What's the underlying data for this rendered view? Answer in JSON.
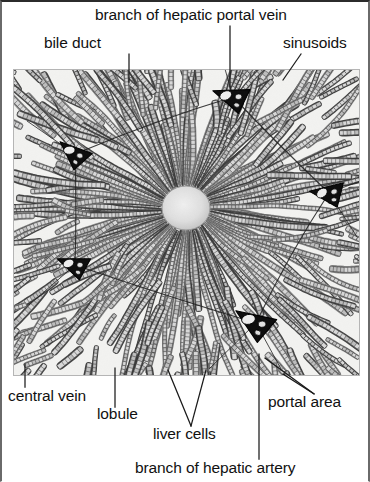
{
  "figure": {
    "type": "histology-micrograph",
    "caption_labels": [
      "branch of hepatic portal vein",
      "bile duct",
      "sinusoids",
      "central vein",
      "lobule",
      "liver cells",
      "portal area",
      "branch of hepatic artery"
    ]
  },
  "labels": {
    "branch_of_hepatic_portal_vein": "branch of hepatic portal vein",
    "bile_duct": "bile duct",
    "sinusoids": "sinusoids",
    "central_vein": "central vein",
    "lobule": "lobule",
    "liver_cells": "liver cells",
    "portal_area": "portal area",
    "branch_of_hepatic_artery": "branch of hepatic artery"
  },
  "colors": {
    "page_background": "#ffffff",
    "text": "#111111",
    "leader_line": "#1a1a1a",
    "tissue_dark": "#3a3a3a",
    "tissue_mid": "#7d7d7d",
    "tissue_light": "#e8e8e8",
    "central_vein_lumen": "#dedede",
    "portal_triad_fill": "#0d0d0d",
    "frame_border": "#5a5a5a"
  },
  "structures": {
    "central_vein": {
      "cx": 173,
      "cy": 139,
      "r": 24
    },
    "portal_triads": [
      {
        "name": "portal-triad-top",
        "cx": 220,
        "cy": 28,
        "rot": -8,
        "scale": 1.0
      },
      {
        "name": "portal-triad-upper-left",
        "cx": 62,
        "cy": 85,
        "rot": 14,
        "scale": 0.92
      },
      {
        "name": "portal-triad-right",
        "cx": 316,
        "cy": 124,
        "rot": -20,
        "scale": 0.95
      },
      {
        "name": "portal-triad-left",
        "cx": 62,
        "cy": 196,
        "rot": -6,
        "scale": 0.9
      },
      {
        "name": "portal-triad-bottom",
        "cx": 243,
        "cy": 254,
        "rot": 6,
        "scale": 1.12
      }
    ],
    "lobule_outline": [
      [
        220,
        28
      ],
      [
        62,
        85
      ],
      [
        62,
        196
      ],
      [
        243,
        254
      ],
      [
        316,
        124
      ]
    ]
  }
}
